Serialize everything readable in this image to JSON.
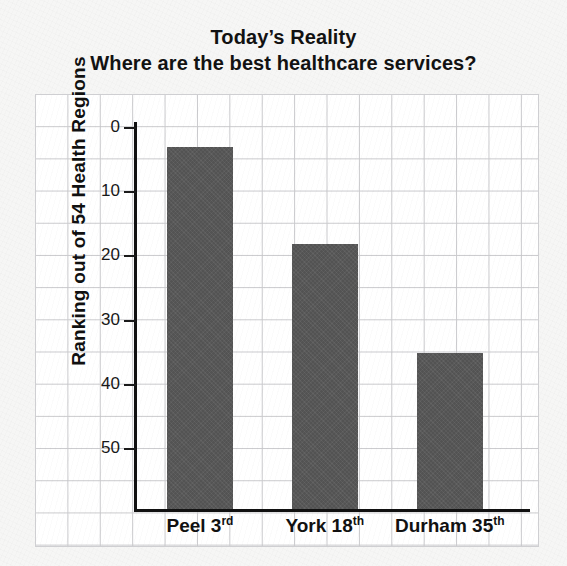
{
  "chart_data": {
    "type": "bar",
    "title": "Today’s Reality",
    "subtitle": "Where are the best healthcare services?",
    "categories": [
      "Peel 3rd",
      "York 18th",
      "Durham 35th"
    ],
    "category_parts": [
      {
        "name": "Peel",
        "rank": "3",
        "ordinal": "rd"
      },
      {
        "name": "York",
        "rank": "18",
        "ordinal": "th"
      },
      {
        "name": "Durham",
        "rank": "35",
        "ordinal": "th"
      }
    ],
    "values": [
      3,
      18,
      35
    ],
    "xlabel": "",
    "ylabel": "Ranking out of 54 Health Regions",
    "ylim": [
      0,
      59.5
    ],
    "y_inverted": true,
    "yticks": [
      0,
      10,
      20,
      30,
      40,
      50
    ],
    "ytick_labels": [
      "0",
      "10",
      "20",
      "30",
      "40",
      "50"
    ],
    "grid": true,
    "grid_style": "graph-paper",
    "legend": "none",
    "bar_color": "#585858",
    "background_color": "#f6f6f5",
    "plot_background_color": "#ffffff",
    "gridline_color": "#c9c9cc",
    "axis_color": "#111111",
    "text_color": "#121212"
  },
  "geometry": {
    "plot": {
      "left": 36,
      "top": 95,
      "width": 502,
      "height": 451
    },
    "axis_origin_x": 134,
    "baseline_y": 509,
    "value_zero_y": 128,
    "px_per_unit": 6.42,
    "bars": [
      {
        "left": 167,
        "width": 66
      },
      {
        "left": 292,
        "width": 66
      },
      {
        "left": 417,
        "width": 66
      }
    ],
    "x_label_centers": [
      200,
      325,
      450
    ]
  }
}
